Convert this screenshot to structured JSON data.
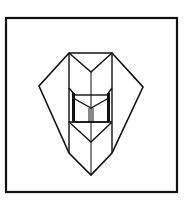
{
  "diagram": {
    "kind": "line-drawing",
    "colors": {
      "stroke": "#111111",
      "background": "#ffffff"
    },
    "frame": {
      "x1": 6,
      "y1": 18,
      "x2": 177,
      "y2": 192
    },
    "shape": {
      "outer_hexagon": [
        [
          69,
          53
        ],
        [
          112,
          53
        ],
        [
          143,
          87
        ],
        [
          91,
          175
        ],
        [
          39,
          86
        ]
      ],
      "left_band": [
        [
          69,
          53
        ],
        [
          69,
          153
        ]
      ],
      "right_band": [
        [
          112,
          53
        ],
        [
          112,
          153
        ]
      ],
      "center_axis": [
        [
          91,
          72
        ],
        [
          91,
          175
        ]
      ],
      "top_v": [
        [
          69,
          53
        ],
        [
          91,
          72
        ],
        [
          112,
          53
        ]
      ],
      "middle_v": [
        [
          72,
          95
        ],
        [
          91,
          108
        ],
        [
          110,
          95
        ]
      ],
      "lower_v": [
        [
          69,
          122
        ],
        [
          91,
          142
        ],
        [
          112,
          122
        ]
      ],
      "inner_rect": [
        [
          74,
          95
        ],
        [
          108,
          122
        ]
      ]
    }
  }
}
